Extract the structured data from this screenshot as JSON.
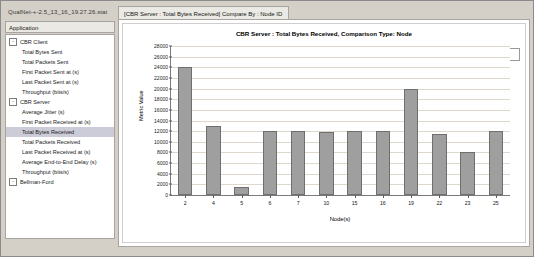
{
  "window": {
    "file_label": "QualNet-+-2.5_13_16_19.27.26.stat",
    "close_glyph": "×"
  },
  "sidebar": {
    "header": "Application",
    "tree": [
      {
        "label": "CBR Client",
        "level": 0,
        "expander": "-",
        "selected": false
      },
      {
        "label": "Total Bytes Sent",
        "level": 1,
        "expander": "",
        "selected": false
      },
      {
        "label": "Total Packets Sent",
        "level": 1,
        "expander": "",
        "selected": false
      },
      {
        "label": "First Packet Sent at (s)",
        "level": 1,
        "expander": "",
        "selected": false
      },
      {
        "label": "Last Packet Sent at (s)",
        "level": 1,
        "expander": "",
        "selected": false
      },
      {
        "label": "Throughput (bits/s)",
        "level": 1,
        "expander": "",
        "selected": false
      },
      {
        "label": "CBR Server",
        "level": 0,
        "expander": "-",
        "selected": false
      },
      {
        "label": "Average Jitter (s)",
        "level": 1,
        "expander": "",
        "selected": false
      },
      {
        "label": "First Packet Received at (s)",
        "level": 1,
        "expander": "",
        "selected": false
      },
      {
        "label": "Total Bytes Received",
        "level": 1,
        "expander": "",
        "selected": true
      },
      {
        "label": "Total Packets Received",
        "level": 1,
        "expander": "",
        "selected": false
      },
      {
        "label": "Last Packet Received at (s)",
        "level": 1,
        "expander": "",
        "selected": false
      },
      {
        "label": "Average End-to-End Delay (s)",
        "level": 1,
        "expander": "",
        "selected": false
      },
      {
        "label": "Throughput (bits/s)",
        "level": 1,
        "expander": "",
        "selected": false
      },
      {
        "label": "Bellman-Ford",
        "level": 0,
        "expander": "-",
        "selected": false
      }
    ]
  },
  "tabs": [
    {
      "label": "[CBR Server :  Total Bytes Received] Compare By : Node ID",
      "active": true
    }
  ],
  "legend": {
    "label": "[1024]",
    "swatch_color": "#9e9e9e"
  },
  "chart_data": {
    "type": "bar",
    "title": "CBR Server :  Total Bytes Received, Comparison Type: Node",
    "xlabel": "Node(s)",
    "ylabel": "Metric Value",
    "categories": [
      "2",
      "4",
      "5",
      "6",
      "7",
      "10",
      "15",
      "16",
      "19",
      "22",
      "23",
      "25"
    ],
    "values": [
      24000,
      13000,
      1500,
      12000,
      12000,
      11800,
      12000,
      12000,
      20000,
      11500,
      8000,
      12000
    ],
    "ylim": [
      0,
      28000
    ],
    "ytick_step": 2000,
    "yticks": [
      0,
      2000,
      4000,
      6000,
      8000,
      10000,
      12000,
      14000,
      16000,
      18000,
      20000,
      22000,
      24000,
      26000,
      28000
    ],
    "grid": true,
    "legend_position": "top-right",
    "series": [
      {
        "name": "[1024]",
        "color": "#9f9f9f",
        "values": [
          24000,
          13000,
          1500,
          12000,
          12000,
          11800,
          12000,
          12000,
          20000,
          11500,
          8000,
          12000
        ]
      }
    ]
  }
}
